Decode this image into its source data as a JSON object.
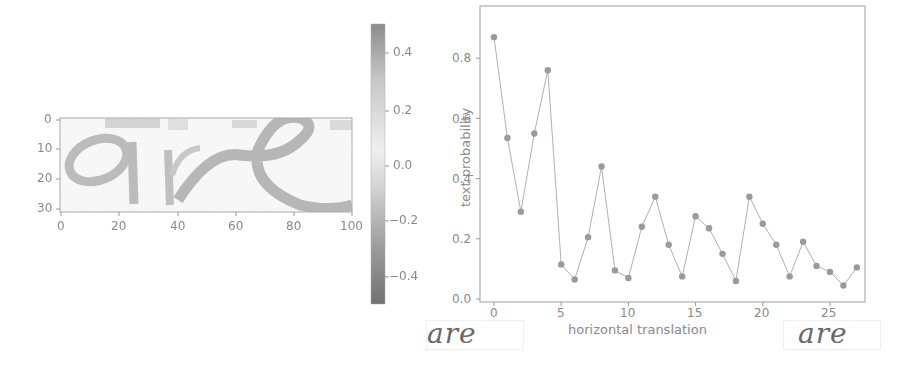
{
  "chart_data": [
    {
      "type": "heatmap",
      "title": "",
      "description": "Saliency/attribution map of handwritten word 'are'",
      "xlabel": "",
      "ylabel": "",
      "x_ticks": [
        "0",
        "20",
        "40",
        "60",
        "80",
        "100"
      ],
      "y_ticks": [
        "0",
        "10",
        "20",
        "30"
      ],
      "xlim": [
        0,
        100
      ],
      "ylim": [
        30,
        0
      ],
      "colorbar": {
        "ticks": [
          "0.4",
          "0.2",
          "0.0",
          "−0.2",
          "−0.4"
        ],
        "range": [
          -0.5,
          0.5
        ]
      },
      "depicted_word": "are"
    },
    {
      "type": "line",
      "title": "",
      "xlabel": "horizontal translation",
      "ylabel": "text probability",
      "x_ticks": [
        "0",
        "5",
        "10",
        "15",
        "20",
        "25"
      ],
      "y_ticks": [
        "0.0",
        "0.2",
        "0.4",
        "0.6",
        "0.8"
      ],
      "xlim": [
        -1,
        28
      ],
      "ylim": [
        0,
        0.92
      ],
      "grid": false,
      "x": [
        0,
        1,
        2,
        3,
        4,
        5,
        6,
        7,
        8,
        9,
        10,
        11,
        12,
        13,
        14,
        15,
        16,
        17,
        18,
        19,
        20,
        21,
        22,
        23,
        24,
        25,
        26,
        27
      ],
      "series": [
        {
          "name": "text probability",
          "values": [
            0.87,
            0.535,
            0.29,
            0.55,
            0.76,
            0.115,
            0.065,
            0.205,
            0.44,
            0.095,
            0.07,
            0.24,
            0.34,
            0.18,
            0.075,
            0.275,
            0.235,
            0.15,
            0.06,
            0.34,
            0.25,
            0.18,
            0.075,
            0.19,
            0.11,
            0.09,
            0.045,
            0.105
          ]
        }
      ],
      "annotations": [
        {
          "position": "bottom-left",
          "content": "word image 'are' (translation 0)"
        },
        {
          "position": "bottom-right",
          "content": "word image 'are' (translation 27)"
        }
      ]
    }
  ],
  "labels": {
    "heat_x_ticks": [
      "0",
      "20",
      "40",
      "60",
      "80",
      "100"
    ],
    "heat_y_ticks": [
      "0",
      "10",
      "20",
      "30"
    ],
    "cbar_ticks": [
      "0.4",
      "0.2",
      "0.0",
      "−0.2",
      "−0.4"
    ],
    "line_x_ticks": [
      "0",
      "5",
      "10",
      "15",
      "20",
      "25"
    ],
    "line_y_ticks": [
      "0.0",
      "0.2",
      "0.4",
      "0.6",
      "0.8"
    ],
    "xlabel": "horizontal translation",
    "ylabel": "text probability",
    "word_left": "are",
    "word_right": "are"
  },
  "colors": {
    "line": "#b0b0b0",
    "marker": "#9a9a9a",
    "axis": "#999999",
    "heat_stroke": "#a8a8a8",
    "cbar_top": "#8c8c8c",
    "cbar_mid": "#f0f0f0",
    "cbar_bottom": "#707070"
  }
}
